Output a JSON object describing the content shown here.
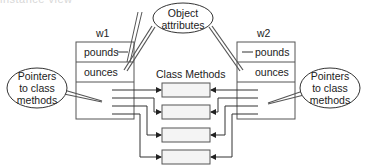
{
  "clipped_header": "instance view",
  "objects": [
    {
      "name": "w1",
      "attributes": [
        "pounds",
        "ounces"
      ]
    },
    {
      "name": "w2",
      "attributes": [
        "pounds",
        "ounces"
      ]
    }
  ],
  "class_methods": {
    "title": "Class Methods",
    "count": 4
  },
  "callouts": {
    "object_attributes": {
      "line1": "Object",
      "line2": "attributes"
    },
    "pointers_left": {
      "line1": "Pointers",
      "line2": "to class",
      "line3": "methods"
    },
    "pointers_right": {
      "line1": "Pointers",
      "line2": "to class",
      "line3": "methods"
    }
  },
  "colors": {
    "stroke": "#555555",
    "method_fill": "#f4f4f4",
    "box_fill": "#ffffff"
  }
}
